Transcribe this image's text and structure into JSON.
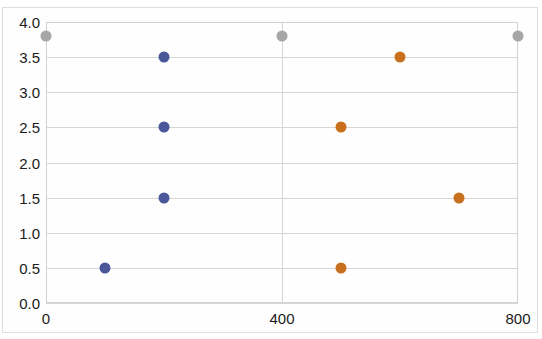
{
  "chart_data": {
    "type": "scatter",
    "title": "",
    "xlabel": "",
    "ylabel": "",
    "xlim": [
      0,
      800
    ],
    "ylim": [
      0.0,
      4.0
    ],
    "xticks": [
      0,
      400,
      800
    ],
    "xtick_labels": [
      "0",
      "400",
      "800"
    ],
    "yticks": [
      0.0,
      0.5,
      1.0,
      1.5,
      2.0,
      2.5,
      3.0,
      3.5,
      4.0
    ],
    "ytick_labels": [
      "0.0",
      "0.5",
      "1.0",
      "1.5",
      "2.0",
      "2.5",
      "3.0",
      "3.5",
      "4.0"
    ],
    "grid": "horizontal-and-vertical",
    "legend": "none",
    "series": [
      {
        "name": "series-blue",
        "color": "#4a5899",
        "points": [
          {
            "x": 100,
            "y": 0.5
          },
          {
            "x": 200,
            "y": 1.5
          },
          {
            "x": 200,
            "y": 2.5
          },
          {
            "x": 200,
            "y": 3.5
          }
        ]
      },
      {
        "name": "series-orange",
        "color": "#c8701e",
        "points": [
          {
            "x": 500,
            "y": 0.5
          },
          {
            "x": 700,
            "y": 1.5
          },
          {
            "x": 500,
            "y": 2.5
          },
          {
            "x": 600,
            "y": 3.5
          }
        ]
      },
      {
        "name": "series-gray",
        "color": "#a6a6a6",
        "points": [
          {
            "x": 0,
            "y": 3.8
          },
          {
            "x": 400,
            "y": 3.8
          },
          {
            "x": 800,
            "y": 3.8
          }
        ]
      }
    ]
  },
  "plot_geometry": {
    "left": 46,
    "top": 22,
    "width": 472,
    "height": 281
  }
}
